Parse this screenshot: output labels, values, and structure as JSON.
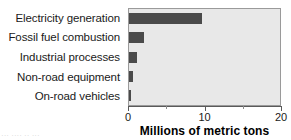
{
  "chart_data": {
    "type": "bar",
    "orientation": "horizontal",
    "title": "",
    "xlabel": "Millions of metric tons",
    "ylabel": "",
    "xlim": [
      0,
      20
    ],
    "xticks": [
      0,
      10,
      20
    ],
    "xtick_labels": [
      "0",
      "10",
      "20"
    ],
    "minor_xticks": [
      5,
      15
    ],
    "grid": false,
    "legend": false,
    "categories": [
      "Electricity generation",
      "Fossil fuel combustion",
      "Industrial processes",
      "Non-road equipment",
      "On-road vehicles"
    ],
    "values": [
      9.5,
      2.0,
      1.0,
      0.5,
      0.2
    ],
    "bars": [
      {
        "label": "Electricity generation",
        "value": 9.5
      },
      {
        "label": "Fossil fuel combustion",
        "value": 2.0
      },
      {
        "label": "Industrial processes",
        "value": 1.0
      },
      {
        "label": "Non-road equipment",
        "value": 0.5
      },
      {
        "label": "On-road vehicles",
        "value": 0.2
      }
    ],
    "colors": {
      "bar": "#4a4a4a",
      "plot_background": "#e8e8e8",
      "axis": "#5a5a5a",
      "text": "#1a1a1a",
      "figure_background": "#ffffff"
    }
  },
  "caption_artifact": "··· ···· ·· ···"
}
